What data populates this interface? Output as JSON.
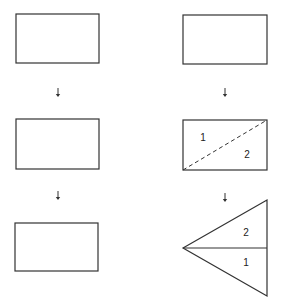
{
  "colors": {
    "stroke": "#333333",
    "background": "#ffffff"
  },
  "left_column": {
    "rects": [
      {
        "x": 16,
        "y": 14,
        "w": 83,
        "h": 49
      },
      {
        "x": 16,
        "y": 119,
        "w": 83,
        "h": 50
      },
      {
        "x": 15,
        "y": 223,
        "w": 83,
        "h": 48
      }
    ],
    "arrows": [
      {
        "x": 58,
        "y1": 88,
        "y2": 97
      },
      {
        "x": 58,
        "y1": 191,
        "y2": 200
      }
    ]
  },
  "right_column": {
    "rects": [
      {
        "x": 183,
        "y": 15,
        "w": 84,
        "h": 49
      },
      {
        "x": 183,
        "y": 120,
        "w": 84,
        "h": 50
      }
    ],
    "arrows": [
      {
        "x": 225,
        "y1": 88,
        "y2": 97
      },
      {
        "x": 225,
        "y1": 193,
        "y2": 202
      }
    ],
    "diagonal_fold": {
      "x1": 183,
      "y1": 170,
      "x2": 267,
      "y2": 120,
      "style": "dashed"
    },
    "rect_labels": [
      {
        "text": "1",
        "x": 203,
        "y": 141
      },
      {
        "text": "2",
        "x": 247,
        "y": 158
      }
    ],
    "triangle": {
      "tip": {
        "x": 183,
        "y": 248
      },
      "top": {
        "x": 267,
        "y": 200
      },
      "bottom": {
        "x": 267,
        "y": 296
      },
      "midline": {
        "x1": 183,
        "y1": 248,
        "x2": 267,
        "y2": 248
      }
    },
    "triangle_labels": [
      {
        "text": "2",
        "x": 246,
        "y": 236
      },
      {
        "text": "1",
        "x": 246,
        "y": 266
      }
    ]
  }
}
